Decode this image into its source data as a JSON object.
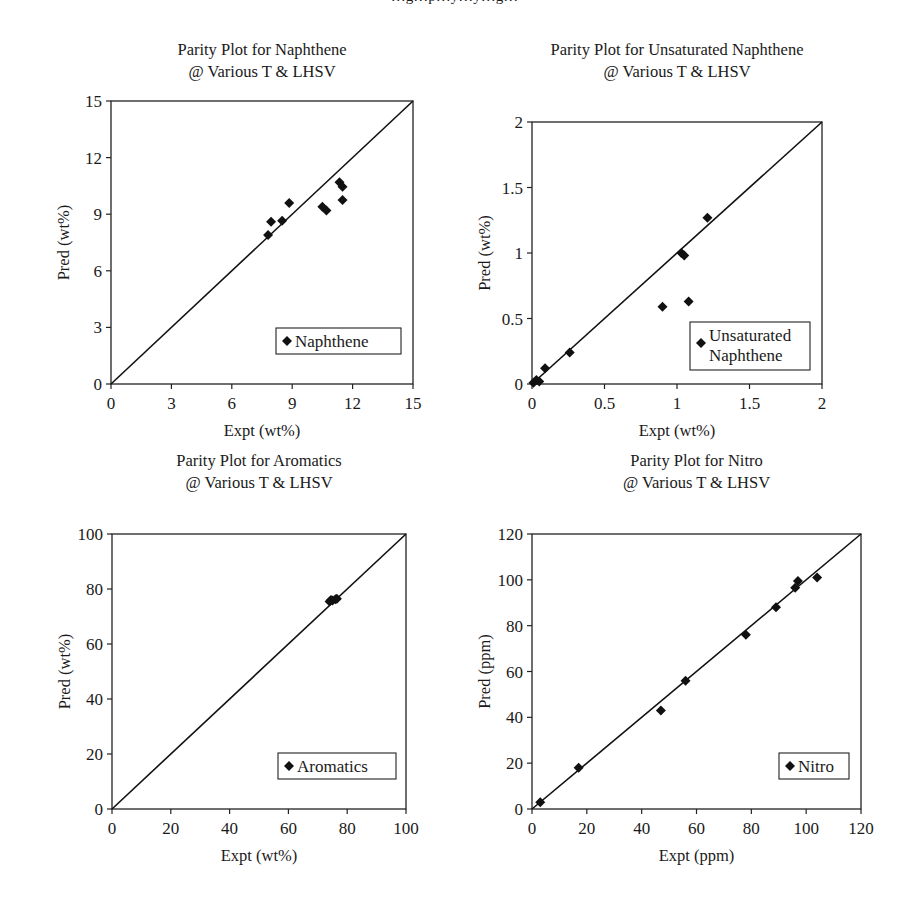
{
  "page": {
    "caption_fragment": "…g…p…y…y…g…"
  },
  "chart_data": [
    {
      "type": "scatter",
      "id": "naphthene",
      "title": "Parity Plot for Naphthene",
      "subtitle": "@ Various T & LHSV",
      "xlabel": "Expt (wt%)",
      "ylabel": "Pred (wt%)",
      "xlim": [
        0,
        15
      ],
      "ylim": [
        0,
        15
      ],
      "xticks": [
        0,
        3,
        6,
        9,
        12,
        15
      ],
      "yticks": [
        0,
        3,
        6,
        9,
        12,
        15
      ],
      "xtick_labels": [
        "0",
        "3",
        "6",
        "9",
        "12",
        "15"
      ],
      "ytick_labels": [
        "0",
        "3",
        "6",
        "9",
        "12",
        "15"
      ],
      "grid": false,
      "parity_line": true,
      "legend": {
        "entries": [
          "Naphthene"
        ],
        "position": "lower right"
      },
      "series": [
        {
          "name": "Naphthene",
          "marker": "diamond",
          "x": [
            7.8,
            7.95,
            8.5,
            8.85,
            10.5,
            10.7,
            11.35,
            11.5,
            11.5
          ],
          "y": [
            7.9,
            8.6,
            8.65,
            9.6,
            9.4,
            9.2,
            10.7,
            10.45,
            9.75
          ]
        }
      ],
      "frame": {
        "left": 111,
        "top": 101,
        "right": 413,
        "bottom": 384
      }
    },
    {
      "type": "scatter",
      "id": "unsaturated-naphthene",
      "title": "Parity Plot for Unsaturated Naphthene",
      "subtitle": "@ Various T & LHSV",
      "xlabel": "Expt (wt%)",
      "ylabel": "Pred (wt%)",
      "xlim": [
        0,
        2
      ],
      "ylim": [
        0,
        2
      ],
      "xticks": [
        0,
        0.5,
        1,
        1.5,
        2
      ],
      "yticks": [
        0,
        0.5,
        1,
        1.5,
        2
      ],
      "xtick_labels": [
        "0",
        "0.5",
        "1",
        "1.5",
        "2"
      ],
      "ytick_labels": [
        "0",
        "0.5",
        "1",
        "1.5",
        "2"
      ],
      "grid": false,
      "parity_line": true,
      "legend": {
        "entries": [
          "Unsaturated",
          "Naphthene"
        ],
        "position": "lower right"
      },
      "series": [
        {
          "name": "Unsaturated Naphthene",
          "marker": "diamond",
          "x": [
            0.01,
            0.03,
            0.05,
            0.09,
            0.26,
            0.9,
            1.03,
            1.05,
            1.08,
            1.21
          ],
          "y": [
            0.01,
            0.03,
            0.02,
            0.12,
            0.24,
            0.59,
            1.0,
            0.98,
            0.63,
            1.27
          ]
        }
      ],
      "frame": {
        "left": 532,
        "top": 122,
        "right": 822,
        "bottom": 384
      }
    },
    {
      "type": "scatter",
      "id": "aromatics",
      "title": "Parity Plot for Aromatics",
      "subtitle": "@ Various T & LHSV",
      "xlabel": "Expt (wt%)",
      "ylabel": "Pred (wt%)",
      "xlim": [
        0,
        100
      ],
      "ylim": [
        0,
        100
      ],
      "xticks": [
        0,
        20,
        40,
        60,
        80,
        100
      ],
      "yticks": [
        0,
        20,
        40,
        60,
        80,
        100
      ],
      "xtick_labels": [
        "0",
        "20",
        "40",
        "60",
        "80",
        "100"
      ],
      "ytick_labels": [
        "0",
        "20",
        "40",
        "60",
        "80",
        "100"
      ],
      "grid": false,
      "parity_line": true,
      "legend": {
        "entries": [
          "Aromatics"
        ],
        "position": "lower right"
      },
      "series": [
        {
          "name": "Aromatics",
          "marker": "diamond",
          "x": [
            74,
            74.5,
            75,
            76,
            76.5
          ],
          "y": [
            75.5,
            76,
            75.8,
            76.3,
            76.5
          ]
        }
      ],
      "frame": {
        "left": 112,
        "top": 534,
        "right": 406,
        "bottom": 809
      }
    },
    {
      "type": "scatter",
      "id": "nitro",
      "title": "Parity Plot for Nitro",
      "subtitle": "@ Various T & LHSV",
      "xlabel": "Expt (ppm)",
      "ylabel": "Pred (ppm)",
      "xlim": [
        0,
        120
      ],
      "ylim": [
        0,
        120
      ],
      "xticks": [
        0,
        20,
        40,
        60,
        80,
        100,
        120
      ],
      "yticks": [
        0,
        20,
        40,
        60,
        80,
        100,
        120
      ],
      "xtick_labels": [
        "0",
        "20",
        "40",
        "60",
        "80",
        "100",
        "120"
      ],
      "ytick_labels": [
        "0",
        "20",
        "40",
        "60",
        "80",
        "100",
        "120"
      ],
      "grid": false,
      "parity_line": true,
      "legend": {
        "entries": [
          "Nitro"
        ],
        "position": "lower right"
      },
      "series": [
        {
          "name": "Nitro",
          "marker": "diamond",
          "x": [
            3,
            17,
            47,
            56,
            78,
            89,
            96,
            97,
            104
          ],
          "y": [
            3,
            18,
            43,
            56,
            76,
            88,
            96.5,
            99.5,
            101
          ]
        }
      ],
      "frame": {
        "left": 532,
        "top": 534,
        "right": 861,
        "bottom": 809
      }
    }
  ]
}
